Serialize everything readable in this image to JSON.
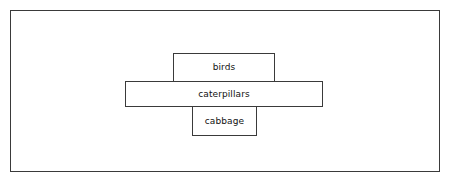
{
  "figure": {
    "type": "ecological-pyramid",
    "background_color": "#ffffff",
    "line_color": "#3a3a3a",
    "text_color": "#111111"
  },
  "frame": {
    "name": "outer-border"
  },
  "levels": [
    {
      "id": "top",
      "label": "birds",
      "position": "top"
    },
    {
      "id": "middle",
      "label": "caterpillars",
      "position": "middle"
    },
    {
      "id": "bottom",
      "label": "cabbage",
      "position": "bottom"
    }
  ]
}
